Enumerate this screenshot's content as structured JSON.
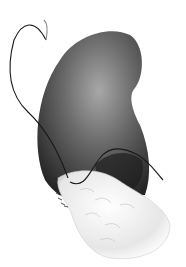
{
  "illustration": {
    "subject": "kidney with suture and tissue graft",
    "colors": {
      "organ_dark": "#2a2a2a",
      "organ_mid": "#6a6a6a",
      "organ_light": "#a8a8a8",
      "tissue": "#eeeeee",
      "suture": "#1a1a1a",
      "background": "#ffffff"
    }
  }
}
